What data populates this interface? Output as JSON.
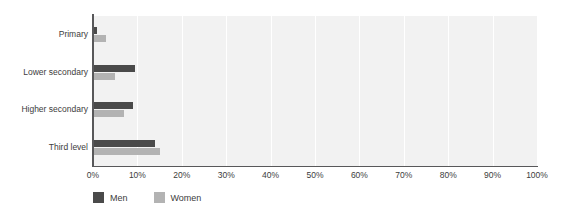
{
  "chart_data": {
    "type": "bar",
    "orientation": "horizontal",
    "title": "",
    "subtitle": "",
    "xlabel": "",
    "ylabel": "",
    "xlim": [
      0,
      100
    ],
    "grid": true,
    "grid_axis": "x",
    "legend_position": "bottom-left",
    "categories": [
      "Primary",
      "Lower secondary",
      "Higher secondary",
      "Third level"
    ],
    "x_tick_labels": [
      "0%",
      "10%",
      "20%",
      "30%",
      "40%",
      "50%",
      "60%",
      "70%",
      "80%",
      "90%",
      "100%"
    ],
    "x_tick_values": [
      0,
      10,
      20,
      30,
      40,
      50,
      60,
      70,
      80,
      90,
      100
    ],
    "series": [
      {
        "name": "Men",
        "color": "#4a4a4a",
        "values": [
          1,
          9.5,
          9,
          14
        ]
      },
      {
        "name": "Women",
        "color": "#b3b3b3",
        "values": [
          3,
          5,
          7,
          15
        ]
      }
    ]
  },
  "colors": {
    "men": "#4a4a4a",
    "women": "#b3b3b3",
    "plot_background": "#f2f2f2",
    "gridline": "#ffffff",
    "axis": "#58585a",
    "text": "#3c3c3c"
  }
}
